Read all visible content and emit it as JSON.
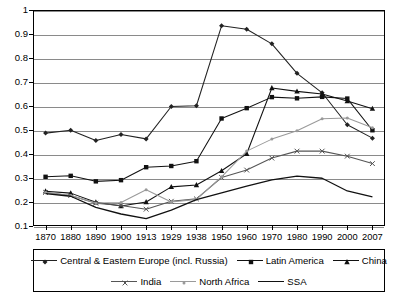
{
  "chart_data": {
    "type": "line",
    "title": "",
    "subtitle": "",
    "xlabel": "",
    "ylabel": "",
    "grid": true,
    "legend_position": "bottom",
    "categories": [
      "1870",
      "1880",
      "1890",
      "1900",
      "1913",
      "1929",
      "1938",
      "1950",
      "1960",
      "1970",
      "1980",
      "1990",
      "2000",
      "2007"
    ],
    "ylim": [
      0.1,
      1.0
    ],
    "yticks": [
      "0.1",
      "0.2",
      "0.3",
      "0.4",
      "0.5",
      "0.6",
      "0.7",
      "0.8",
      "0.9",
      "1"
    ],
    "series": [
      {
        "name": "Central & Eastern Europe (incl. Russia)",
        "marker": "diamond",
        "color": "#222222",
        "values": [
          0.487,
          0.499,
          0.456,
          0.481,
          0.463,
          0.598,
          0.601,
          0.934,
          0.92,
          0.859,
          0.736,
          0.655,
          0.522,
          0.466
        ]
      },
      {
        "name": "Latin America",
        "marker": "square",
        "color": "#111111",
        "values": [
          0.305,
          0.309,
          0.286,
          0.291,
          0.345,
          0.35,
          0.37,
          0.548,
          0.591,
          0.637,
          0.632,
          0.638,
          0.631,
          0.499
        ]
      },
      {
        "name": "China",
        "marker": "triangle",
        "color": "#111111",
        "values": [
          0.245,
          0.237,
          0.199,
          0.183,
          0.2,
          0.263,
          0.271,
          0.33,
          0.401,
          0.675,
          0.661,
          0.65,
          0.621,
          0.589
        ]
      },
      {
        "name": "India",
        "marker": "cross",
        "color": "#555555",
        "values": [
          0.24,
          0.227,
          0.195,
          0.185,
          0.17,
          0.203,
          0.213,
          0.302,
          0.333,
          0.383,
          0.412,
          0.412,
          0.391,
          0.36
        ]
      },
      {
        "name": "North Africa",
        "marker": "dot",
        "color": "#9a9a9a",
        "values": [
          0.24,
          0.227,
          0.196,
          0.198,
          0.251,
          0.2,
          0.211,
          0.305,
          0.412,
          0.462,
          0.497,
          0.547,
          0.55,
          0.509
        ]
      },
      {
        "name": "SSA",
        "marker": "line",
        "color": "#111111",
        "values": [
          0.235,
          0.224,
          0.178,
          0.15,
          0.131,
          0.166,
          0.21,
          0.238,
          0.266,
          0.292,
          0.308,
          0.299,
          0.246,
          0.221
        ]
      }
    ]
  },
  "legend": {
    "items": [
      {
        "label": "Central & Eastern Europe (incl. Russia)"
      },
      {
        "label": "Latin America"
      },
      {
        "label": "China"
      },
      {
        "label": "India"
      },
      {
        "label": "North Africa"
      },
      {
        "label": "SSA"
      }
    ]
  }
}
